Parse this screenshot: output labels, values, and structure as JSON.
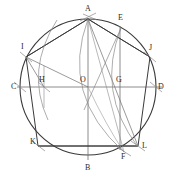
{
  "figure": {
    "kind": "geometric-construction",
    "width": 175,
    "height": 181,
    "background_color": "#ffffff",
    "stroke_color_main": "#3a3a3a",
    "stroke_color_light": "#8a8a8a",
    "label_color": "#2b2b2b"
  },
  "circle": {
    "center_label": "O",
    "center_x": 88,
    "center_y": 87,
    "radius": 68
  },
  "points": [
    {
      "label": "A",
      "x": 88,
      "y": 19,
      "label_x": 85,
      "label_y": 5
    },
    {
      "label": "E",
      "x": 121,
      "y": 28,
      "label_x": 118,
      "label_y": 14
    },
    {
      "label": "I",
      "x": 26,
      "y": 57,
      "label_x": 21,
      "label_y": 43
    },
    {
      "label": "J",
      "x": 150,
      "y": 57,
      "label_x": 149,
      "label_y": 44
    },
    {
      "label": "C",
      "x": 20,
      "y": 87,
      "label_x": 11,
      "label_y": 83
    },
    {
      "label": "H",
      "x": 44,
      "y": 87,
      "label_x": 39,
      "label_y": 76
    },
    {
      "label": "O",
      "x": 88,
      "y": 87,
      "label_x": 80,
      "label_y": 76
    },
    {
      "label": "G",
      "x": 120,
      "y": 87,
      "label_x": 116,
      "label_y": 76
    },
    {
      "label": "D",
      "x": 156,
      "y": 87,
      "label_x": 158,
      "label_y": 83
    },
    {
      "label": "K",
      "x": 38,
      "y": 146,
      "label_x": 30,
      "label_y": 138
    },
    {
      "label": "L",
      "x": 138,
      "y": 146,
      "label_x": 142,
      "label_y": 142
    },
    {
      "label": "F",
      "x": 124,
      "y": 152,
      "label_x": 121,
      "label_y": 153
    },
    {
      "label": "B",
      "x": 88,
      "y": 155,
      "label_x": 85,
      "label_y": 164
    }
  ],
  "elements": {
    "circle_name": "main-circle",
    "vertical_diameter": "AB",
    "horizontal_diameter": "CD",
    "pentagon": "A-I-K-L-J",
    "lower_chord": "KL",
    "vertical_line_g": "EG-F",
    "arc_labels": [
      "arc-from-A",
      "arc-from-H",
      "arc-from-G",
      "arc-through-E-F"
    ]
  }
}
